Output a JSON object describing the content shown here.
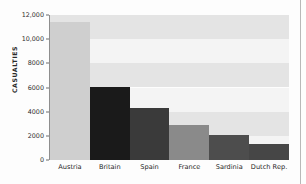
{
  "chart_data": {
    "type": "bar",
    "title": "",
    "xlabel": "",
    "ylabel": "CASUALTIES",
    "categories": [
      "Austria",
      "Britain",
      "Spain",
      "France",
      "Sardinia",
      "Dutch Rep."
    ],
    "values": [
      11400,
      6050,
      4300,
      2900,
      2100,
      1300
    ],
    "series": [
      {
        "name": "Casualties",
        "values": [
          11400,
          6050,
          4300,
          2900,
          2100,
          1300
        ]
      }
    ],
    "bar_colors": [
      "#cfcfcf",
      "#1a1a1a",
      "#3a3a3a",
      "#8a8a8a",
      "#4d4d4d",
      "#464646"
    ],
    "ylim": [
      0,
      12000
    ],
    "ytick_values": [
      0,
      2000,
      4000,
      6000,
      8000,
      10000,
      12000
    ],
    "ytick_labels": [
      "0",
      "2000",
      "4000",
      "6000",
      "8000",
      "10,000",
      "12,000"
    ],
    "grid": false,
    "background_bands": true,
    "band_colors": [
      "#e4e4e4",
      "#f4f4f4"
    ],
    "legend": null,
    "legend_position": "none",
    "annotations": []
  }
}
